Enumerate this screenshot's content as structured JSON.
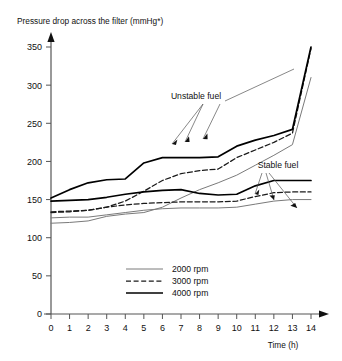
{
  "chart_data": {
    "type": "line",
    "title": "Pressure drop across the filter (mmHg*)",
    "xlabel": "Time (h)",
    "ylabel": "Pressure drop across the filter (mmHg*)",
    "xlim": [
      0,
      14
    ],
    "ylim": [
      0,
      360
    ],
    "xticks": [
      0,
      1,
      2,
      3,
      4,
      5,
      6,
      7,
      8,
      9,
      10,
      11,
      12,
      13,
      14
    ],
    "yticks": [
      0,
      50,
      100,
      150,
      200,
      250,
      300,
      350
    ],
    "xtick_labels": [
      "0",
      "1",
      "2",
      "3",
      "4",
      "5",
      "6",
      "7",
      "8",
      "9",
      "10",
      "11",
      "12",
      "13",
      "14"
    ],
    "ytick_labels": [
      "0",
      "50",
      "100",
      "150",
      "200",
      "250",
      "300",
      "350"
    ],
    "grid": false,
    "legend_position": "bottom-center",
    "legend": [
      {
        "label": "2000 rpm",
        "style": "thin-solid",
        "color": "#7a7a7a"
      },
      {
        "label": "3000 rpm",
        "style": "dashed",
        "color": "#1a1a1a"
      },
      {
        "label": "4000 rpm",
        "style": "thick-solid",
        "color": "#000000"
      }
    ],
    "annotations": [
      {
        "text": "Unstable fuel",
        "x": 7.4,
        "y": 281
      },
      {
        "text": "Stable fuel",
        "x": 10.6,
        "y": 193
      }
    ],
    "series": [
      {
        "name": "Unstable fuel 2000 rpm",
        "group": "unstable",
        "rpm": 2000,
        "style": "thin-solid",
        "x": [
          0,
          1,
          2,
          3,
          4,
          5,
          6,
          7,
          8,
          9,
          10,
          11,
          12,
          13,
          14
        ],
        "values": [
          119,
          120,
          122,
          128,
          131,
          133,
          140,
          152,
          163,
          172,
          182,
          195,
          208,
          222,
          310
        ]
      },
      {
        "name": "Unstable fuel 3000 rpm",
        "group": "unstable",
        "rpm": 3000,
        "style": "dashed",
        "x": [
          0,
          1,
          2,
          3,
          4,
          5,
          6,
          7,
          8,
          9,
          10,
          11,
          12,
          13,
          14
        ],
        "values": [
          133,
          134,
          136,
          140,
          148,
          161,
          175,
          184,
          188,
          190,
          205,
          215,
          225,
          237,
          348
        ]
      },
      {
        "name": "Unstable fuel 4000 rpm",
        "group": "unstable",
        "rpm": 4000,
        "style": "thick-solid",
        "x": [
          0,
          1,
          2,
          3,
          4,
          5,
          6,
          7,
          8,
          9,
          10,
          11,
          12,
          13,
          14
        ],
        "values": [
          152,
          163,
          172,
          176,
          177,
          198,
          205,
          205,
          205,
          206,
          220,
          228,
          234,
          242,
          350
        ]
      },
      {
        "name": "Stable fuel 2000 rpm",
        "group": "stable",
        "rpm": 2000,
        "style": "thin-solid",
        "x": [
          0,
          1,
          2,
          3,
          4,
          5,
          6,
          7,
          8,
          9,
          10,
          11,
          12,
          13,
          14
        ],
        "values": [
          126,
          127,
          127,
          130,
          133,
          136,
          138,
          139,
          139,
          139,
          140,
          144,
          148,
          150,
          150
        ]
      },
      {
        "name": "Stable fuel 3000 rpm",
        "group": "stable",
        "rpm": 3000,
        "style": "dashed",
        "x": [
          0,
          1,
          2,
          3,
          4,
          5,
          6,
          7,
          8,
          9,
          10,
          11,
          12,
          13,
          14
        ],
        "values": [
          134,
          135,
          136,
          140,
          143,
          145,
          146,
          147,
          147,
          147,
          148,
          154,
          159,
          160,
          160
        ]
      },
      {
        "name": "Stable fuel 4000 rpm",
        "group": "stable",
        "rpm": 4000,
        "style": "thick-solid",
        "x": [
          0,
          1,
          2,
          3,
          4,
          5,
          6,
          7,
          8,
          9,
          10,
          11,
          12,
          13,
          14
        ],
        "values": [
          148,
          149,
          150,
          153,
          157,
          160,
          162,
          163,
          158,
          156,
          157,
          168,
          175,
          175,
          175
        ]
      }
    ]
  }
}
